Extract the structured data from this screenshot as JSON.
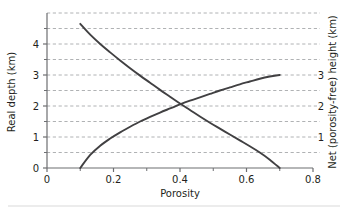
{
  "chart_data": {
    "type": "line",
    "title": "",
    "xlabel": "Porosity",
    "ylabel": "Real depth (km)",
    "ylabel_right": "Net (porosity-free) height (km)",
    "xlim": [
      0,
      0.8
    ],
    "ylim": [
      0,
      5
    ],
    "ylim_right": [
      0,
      5
    ],
    "grid": true,
    "grid_style": "dashed",
    "grid_color": "#a7a9ac",
    "axis_color": "#6d6e71",
    "curve_color": "#414042",
    "legend": "none",
    "xticks": [
      0,
      0.2,
      0.4,
      0.6,
      0.8
    ],
    "xtick_labels": [
      "0",
      "0.2",
      "0.4",
      "0.6",
      "0.8"
    ],
    "xminor_ticks": [
      0.1,
      0.3,
      0.5,
      0.7
    ],
    "yticks": [
      0,
      1,
      2,
      3,
      4
    ],
    "ytick_labels": [
      "0",
      "1",
      "2",
      "3",
      "4"
    ],
    "yminor_ticks": [
      0.5,
      1.5,
      2.5,
      3.5,
      4.5
    ],
    "yticks_right": [
      1,
      2,
      3
    ],
    "ytick_labels_right": [
      "1",
      "2",
      "3"
    ],
    "gridlines": [
      0.5,
      1.0,
      1.5,
      2.0,
      2.5,
      3.0,
      3.5,
      4.0,
      4.5,
      5.0
    ],
    "series": [
      {
        "name": "Real depth",
        "axis": "left",
        "x": [
          0.1,
          0.13,
          0.16,
          0.19,
          0.22,
          0.25,
          0.28,
          0.31,
          0.34,
          0.37,
          0.4,
          0.43,
          0.46,
          0.49,
          0.52,
          0.55,
          0.58,
          0.61,
          0.64,
          0.67,
          0.7
        ],
        "y": [
          4.65,
          4.3,
          4.0,
          3.73,
          3.47,
          3.22,
          2.98,
          2.75,
          2.52,
          2.3,
          2.08,
          1.87,
          1.66,
          1.46,
          1.27,
          1.08,
          0.89,
          0.7,
          0.5,
          0.27,
          0.0
        ]
      },
      {
        "name": "Net (porosity-free) height",
        "axis": "right",
        "x": [
          0.1,
          0.13,
          0.16,
          0.19,
          0.22,
          0.25,
          0.28,
          0.31,
          0.34,
          0.37,
          0.4,
          0.43,
          0.46,
          0.49,
          0.52,
          0.55,
          0.58,
          0.61,
          0.64,
          0.67,
          0.7
        ],
        "y": [
          0.0,
          0.42,
          0.72,
          0.95,
          1.15,
          1.33,
          1.5,
          1.65,
          1.79,
          1.92,
          2.05,
          2.17,
          2.28,
          2.39,
          2.5,
          2.6,
          2.7,
          2.79,
          2.88,
          2.95,
          3.0
        ]
      }
    ],
    "intersection": {
      "x": 0.37,
      "y": 2.0
    }
  },
  "figure": {
    "xlabel": "Porosity",
    "ylabel_left": "Real depth (km)",
    "ylabel_right": "Net (porosity-free) height (km)"
  }
}
